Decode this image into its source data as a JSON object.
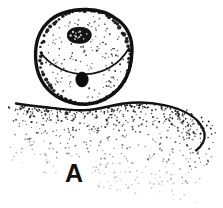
{
  "figure": {
    "domain_kind": "scientific-line-drawing",
    "panel_label": "A",
    "background_color": "#ffffff",
    "ink_color": "#111111",
    "canvas": {
      "width": 223,
      "height": 208
    },
    "parts": {
      "spore_body": {
        "name": "stippled-round-body",
        "outline_style": "thick-beaded-irregular",
        "center": {
          "cx": 85,
          "cy": 57
        },
        "radius": {
          "rx": 46,
          "ry": 48
        },
        "fill": "#ffffff",
        "stroke": "#111111",
        "stroke_width": 3.2
      },
      "division_curve": {
        "name": "interior-dividing-arc",
        "description": "downward curving arc across upper third of body",
        "left_point": {
          "x": 41,
          "y": 52
        },
        "control_point": {
          "x": 85,
          "y": 74
        },
        "right_point": {
          "x": 129,
          "y": 48
        },
        "stroke_width": 1.6
      },
      "upper_nucleus": {
        "name": "textured-dark-nucleus",
        "center": {
          "cx": 79,
          "cy": 35
        },
        "radius": {
          "rx": 11,
          "ry": 7.5
        },
        "fill": "#141414",
        "speckled": true
      },
      "lower_body_dot": {
        "name": "solid-dark-inclusion",
        "center": {
          "cx": 82,
          "cy": 79
        },
        "radius": {
          "rx": 6,
          "ry": 7
        },
        "fill": "#0c0c0c"
      },
      "substrate_mass": {
        "name": "stippled-substrate-mound",
        "description": "stippled mound beneath body, dark upper edge sweeping right then down",
        "edge_points": [
          {
            "x": 16,
            "y": 104
          },
          {
            "x": 46,
            "y": 107
          },
          {
            "x": 80,
            "y": 110
          },
          {
            "x": 118,
            "y": 104
          },
          {
            "x": 150,
            "y": 103
          },
          {
            "x": 180,
            "y": 110
          },
          {
            "x": 200,
            "y": 122
          },
          {
            "x": 205,
            "y": 140
          },
          {
            "x": 196,
            "y": 150
          }
        ],
        "stroke_width": 2.2,
        "stipple_fade": "top-dense to bottom-sparse"
      }
    },
    "stipple": {
      "body_dot_count": 150,
      "substrate_dot_count": 620,
      "dot_color": "#1a1a1a"
    }
  }
}
